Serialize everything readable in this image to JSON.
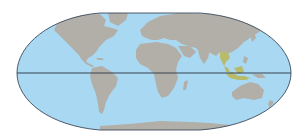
{
  "map": {
    "type": "world-map",
    "projection": "oval (Mollweide-like, flat-polar)",
    "colors": {
      "background": "#ffffff",
      "ocean": "#a9d8f2",
      "land": "#b2aea8",
      "highlight": "#b8ba6c",
      "outline": "#3c4a5a",
      "equator": "#2a3440",
      "coast": "#7fb8dc"
    },
    "features": {
      "equator_line": true,
      "highlighted_region": "Southeast Asia (Thailand, Myanmar, Malaysia, Indonesia)"
    },
    "labels": []
  }
}
